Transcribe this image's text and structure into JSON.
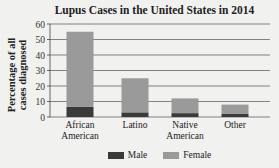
{
  "chart_data": {
    "type": "bar",
    "stacked": true,
    "title": "Lupus Cases in the United States in 2014",
    "xlabel": "",
    "ylabel": "Percentage of all cases diagnosed",
    "ylim": [
      0,
      60
    ],
    "yticks": [
      0,
      10,
      20,
      30,
      40,
      50,
      60
    ],
    "grid": true,
    "legend_position": "bottom",
    "categories": [
      "African American",
      "Latino",
      "Native American",
      "Other"
    ],
    "category_lines": [
      [
        "African",
        "American"
      ],
      [
        "Latino"
      ],
      [
        "Native",
        "American"
      ],
      [
        "Other"
      ]
    ],
    "series": [
      {
        "name": "Male",
        "color": "#3a3a3a",
        "values": [
          6.5,
          3,
          2.5,
          2
        ]
      },
      {
        "name": "Female",
        "color": "#9a9a9a",
        "values": [
          48.5,
          22,
          9.5,
          6
        ]
      }
    ],
    "totals": [
      55,
      25,
      12,
      8
    ]
  },
  "title": "Lupus Cases in the United States in 2014",
  "ylabel_line1": "Percentage of all",
  "ylabel_line2": "cases diagnosed",
  "legend": [
    {
      "label": "Male",
      "color": "#3a3a3a"
    },
    {
      "label": "Female",
      "color": "#9a9a9a"
    }
  ]
}
